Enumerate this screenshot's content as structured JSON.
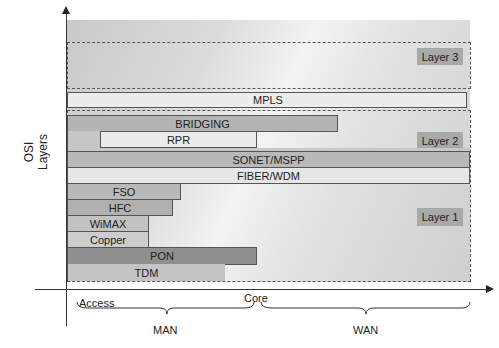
{
  "diagram": {
    "y_axis_label": "OSI Layers",
    "layers": [
      {
        "id": "layer3",
        "label": "Layer 3"
      },
      {
        "id": "layer2",
        "label": "Layer 2"
      },
      {
        "id": "layer1",
        "label": "Layer 1"
      }
    ],
    "bars": [
      {
        "label": "MPLS",
        "layer": "Layer 3/2 boundary",
        "span": "Access to WAN end",
        "color": "#ececec"
      },
      {
        "label": "BRIDGING",
        "layer": "Layer 2",
        "span": "Access to mid-WAN",
        "color": "#b4b4b4"
      },
      {
        "label": "RPR",
        "layer": "Layer 2",
        "span": "Partial MAN to Core",
        "color": "#ebebeb"
      },
      {
        "label": "SONET/MSPP",
        "layer": "Layer 1/2",
        "span": "Access to WAN end",
        "color": "#b9b9b9"
      },
      {
        "label": "FIBER/WDM",
        "layer": "Layer 1",
        "span": "Access to WAN end",
        "color": "#e6e6e6"
      },
      {
        "label": "FSO",
        "layer": "Layer 1",
        "span": "Access",
        "color": "#b9b9b9"
      },
      {
        "label": "HFC",
        "layer": "Layer 1",
        "span": "Access",
        "color": "#b0b0b0"
      },
      {
        "label": "WiMAX",
        "layer": "Layer 1",
        "span": "Access",
        "color": "#c2c2c2"
      },
      {
        "label": "Copper",
        "layer": "Layer 1",
        "span": "Access",
        "color": "#cdcdcd"
      },
      {
        "label": "PON",
        "layer": "Layer 1",
        "span": "Access to Core",
        "color": "#8f8f8f"
      },
      {
        "label": "TDM",
        "layer": "Layer 1",
        "span": "Access to near Core",
        "color": "#c4c4c4"
      }
    ],
    "x_axis": {
      "points": [
        "Access",
        "Core"
      ],
      "regions": [
        "MAN",
        "WAN"
      ]
    }
  }
}
